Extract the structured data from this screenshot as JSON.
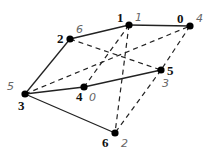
{
  "graph": {
    "nodes": [
      {
        "id": "0",
        "value": "4"
      },
      {
        "id": "1",
        "value": "1"
      },
      {
        "id": "2",
        "value": "6"
      },
      {
        "id": "3",
        "value": "5"
      },
      {
        "id": "4",
        "value": "0"
      },
      {
        "id": "5",
        "value": "3"
      },
      {
        "id": "6",
        "value": "2"
      }
    ],
    "edges": [
      {
        "from": "1",
        "to": "0",
        "style": "solid"
      },
      {
        "from": "1",
        "to": "2",
        "style": "solid"
      },
      {
        "from": "2",
        "to": "3",
        "style": "solid"
      },
      {
        "from": "3",
        "to": "4",
        "style": "solid"
      },
      {
        "from": "4",
        "to": "5",
        "style": "solid"
      },
      {
        "from": "3",
        "to": "6",
        "style": "solid"
      },
      {
        "from": "3",
        "to": "0",
        "style": "dashed"
      },
      {
        "from": "2",
        "to": "5",
        "style": "dashed"
      },
      {
        "from": "1",
        "to": "4",
        "style": "dashed"
      },
      {
        "from": "1",
        "to": "6",
        "style": "dashed"
      },
      {
        "from": "0",
        "to": "5",
        "style": "dashed"
      },
      {
        "from": "5",
        "to": "6",
        "style": "dashed"
      }
    ]
  }
}
